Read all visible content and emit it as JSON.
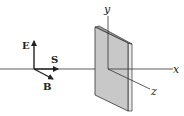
{
  "diagram": {
    "vectors": {
      "E": {
        "label": "E"
      },
      "S": {
        "label": "S"
      },
      "B": {
        "label": "B"
      }
    },
    "axes": {
      "x": {
        "label": "x"
      },
      "y": {
        "label": "y"
      },
      "z": {
        "label": "z"
      }
    },
    "colors": {
      "line": "#333333",
      "plate_face": "#c8c8c8",
      "plate_edge": "#e6e6e6",
      "background": "#ffffff"
    }
  }
}
